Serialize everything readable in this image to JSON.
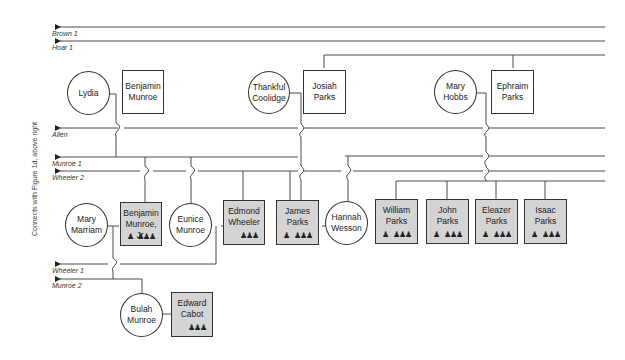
{
  "side_note": "Connects with Figure 1d, above right",
  "connector_labels": [
    {
      "id": "brown1",
      "label": "Brown 1"
    },
    {
      "id": "hoar1",
      "label": "Hoar 1"
    },
    {
      "id": "allen",
      "label": "Allen"
    },
    {
      "id": "munroe1",
      "label": "Munroe 1"
    },
    {
      "id": "wheeler2",
      "label": "Wheeler 2"
    },
    {
      "id": "wheeler1",
      "label": "Wheeler 1"
    },
    {
      "id": "munroe2",
      "label": "Munroe 2"
    }
  ],
  "people": {
    "lydia": {
      "name": "Lydia",
      "shape": "circle",
      "sex": "female"
    },
    "benjamin_munroe": {
      "name": "Benjamin Munroe",
      "line1": "Benjamin",
      "line2": "Munroe",
      "shape": "box",
      "sex": "male"
    },
    "thankful_coolidge": {
      "line1": "Thankful",
      "line2": "Coolidge",
      "shape": "circle",
      "sex": "female"
    },
    "josiah_parks": {
      "line1": "Josiah",
      "line2": "Parks",
      "shape": "box",
      "sex": "male"
    },
    "mary_hobbs": {
      "line1": "Mary",
      "line2": "Hobbs",
      "shape": "circle",
      "sex": "female"
    },
    "ephraim_parks": {
      "line1": "Ephraim",
      "line2": "Parks",
      "shape": "box",
      "sex": "male"
    },
    "mary_marriam": {
      "line1": "Mary",
      "line2": "Marriam",
      "shape": "circle",
      "sex": "female"
    },
    "benjamin_munroe_jr": {
      "line1": "Benjamin",
      "line2": "Munroe, Jr.",
      "shape": "box",
      "shaded": true,
      "icons": [
        "officer-icon",
        "soldiers-icon"
      ]
    },
    "eunice_munroe": {
      "line1": "Eunice",
      "line2": "Munroe",
      "shape": "circle",
      "sex": "female"
    },
    "edmond_wheeler": {
      "line1": "Edmond",
      "line2": "Wheeler",
      "shape": "box",
      "shaded": true,
      "icons": [
        "soldiers-icon"
      ]
    },
    "james_parks": {
      "line1": "James",
      "line2": "Parks",
      "shape": "box",
      "shaded": true,
      "icons": [
        "officer-icon",
        "soldiers-icon"
      ]
    },
    "hannah_wesson": {
      "line1": "Hannah",
      "line2": "Wesson",
      "shape": "circle",
      "sex": "female"
    },
    "william_parks": {
      "line1": "William",
      "line2": "Parks",
      "shape": "box",
      "shaded": true,
      "icons": [
        "officer-icon",
        "soldiers-icon"
      ]
    },
    "john_parks": {
      "line1": "John",
      "line2": "Parks",
      "shape": "box",
      "shaded": true,
      "icons": [
        "officer-icon",
        "soldiers-icon"
      ]
    },
    "eleazer_parks": {
      "line1": "Eleazer",
      "line2": "Parks",
      "shape": "box",
      "shaded": true,
      "icons": [
        "officer-icon",
        "soldiers-icon"
      ]
    },
    "isaac_parks": {
      "line1": "Isaac",
      "line2": "Parks",
      "shape": "box",
      "shaded": true,
      "icons": [
        "officer-icon",
        "soldiers-icon"
      ]
    },
    "bulah_munroe": {
      "line1": "Bulah",
      "line2": "Munroe",
      "shape": "circle",
      "sex": "female"
    },
    "edward_cabot": {
      "line1": "Edward",
      "line2": "Cabot",
      "shape": "box",
      "shaded": true,
      "icons": [
        "soldiers-icon"
      ]
    }
  },
  "colors": {
    "line": "#4a4a4a",
    "shaded_box": "#d4d4d4",
    "border": "#333333"
  }
}
